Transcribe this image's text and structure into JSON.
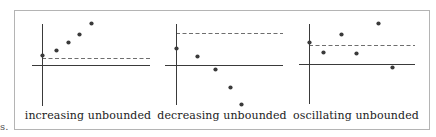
{
  "figure": {
    "left_margin_fragment": "s.",
    "colors": {
      "axis": "#3a3a3a",
      "dashed": "#6e6e6e",
      "point": "#3a3a3a",
      "frame": "#b4b4b4",
      "text": "#222222"
    },
    "panels": [
      {
        "label": "increasing unbounded",
        "label_x": 88,
        "y_axis": {
          "x": 42,
          "y1": 24,
          "y2": 106
        },
        "x_axis": {
          "y": 65,
          "x1": 32,
          "x2": 150
        },
        "dashed": {
          "y": 58,
          "x1": 42,
          "x2": 150
        },
        "points": [
          [
            42,
            55
          ],
          [
            56,
            50
          ],
          [
            68,
            42
          ],
          [
            79,
            34
          ],
          [
            91,
            23
          ]
        ]
      },
      {
        "label": "decreasing unbounded",
        "label_x": 222,
        "y_axis": {
          "x": 176,
          "y1": 24,
          "y2": 105
        },
        "x_axis": {
          "y": 65,
          "x1": 165,
          "x2": 283
        },
        "dashed": {
          "y": 33,
          "x1": 176,
          "x2": 283
        },
        "points": [
          [
            176,
            48
          ],
          [
            197,
            56
          ],
          [
            215,
            69
          ],
          [
            230,
            87
          ],
          [
            241,
            104
          ]
        ]
      },
      {
        "label": "oscillating unbounded",
        "label_x": 356,
        "y_axis": {
          "x": 309,
          "y1": 24,
          "y2": 104
        },
        "x_axis": {
          "y": 64,
          "x1": 299,
          "x2": 415
        },
        "dashed": {
          "y": 45,
          "x1": 309,
          "x2": 415
        },
        "points": [
          [
            309,
            42
          ],
          [
            323,
            52
          ],
          [
            341,
            34
          ],
          [
            356,
            53
          ],
          [
            378,
            23
          ],
          [
            392,
            67
          ]
        ]
      }
    ]
  }
}
